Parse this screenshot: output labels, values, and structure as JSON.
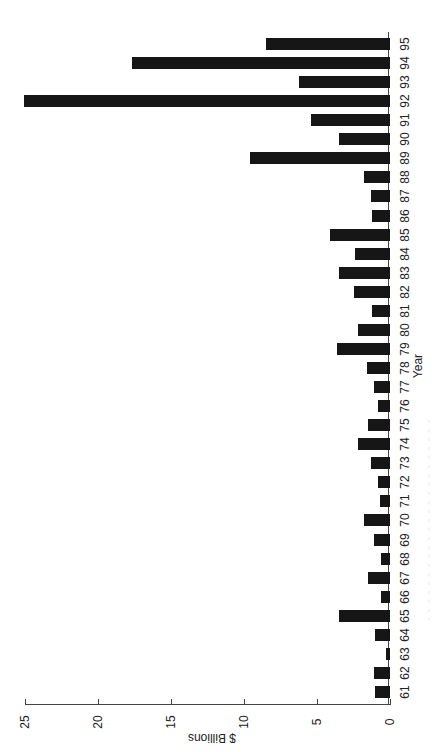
{
  "chart_data": {
    "type": "bar",
    "orientation": "rotated 90° clockwise (value axis runs horizontally at bottom, 0 at right; years run bottom-to-top on right)",
    "title": "",
    "xlabel": "Year",
    "ylabel": "$ Billions",
    "ylim": [
      0,
      25
    ],
    "yticks": [
      0,
      5,
      10,
      15,
      20,
      25
    ],
    "grid": false,
    "legend": null,
    "categories": [
      "61",
      "62",
      "63",
      "64",
      "65",
      "66",
      "67",
      "68",
      "69",
      "70",
      "71",
      "72",
      "73",
      "74",
      "75",
      "76",
      "77",
      "78",
      "79",
      "80",
      "81",
      "82",
      "83",
      "84",
      "85",
      "86",
      "87",
      "88",
      "89",
      "90",
      "91",
      "92",
      "93",
      "94",
      "95"
    ],
    "values": [
      1.0,
      1.1,
      0.3,
      1.0,
      3.5,
      0.6,
      1.5,
      0.6,
      1.1,
      1.8,
      0.7,
      0.8,
      1.3,
      2.2,
      1.5,
      0.8,
      1.1,
      1.6,
      3.6,
      2.2,
      1.2,
      2.5,
      3.5,
      2.4,
      4.1,
      1.2,
      1.3,
      1.8,
      9.6,
      3.5,
      5.4,
      25.1,
      6.2,
      17.7,
      8.5
    ],
    "bar_color": "#161616"
  },
  "labels": {
    "xlabel": "Year",
    "ylabel": "$ Billions"
  }
}
